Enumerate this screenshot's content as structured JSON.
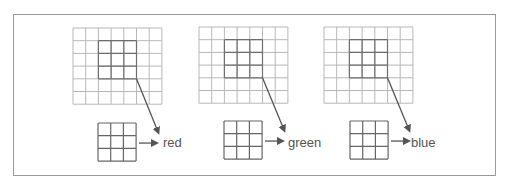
{
  "diagram": {
    "panels": [
      {
        "id": "red",
        "label": "red"
      },
      {
        "id": "green",
        "label": "green"
      },
      {
        "id": "blue",
        "label": "blue"
      }
    ],
    "grid": {
      "columns": 7,
      "rows": 6,
      "highlight": {
        "col_start": 3,
        "row_start": 2,
        "size": 3
      }
    },
    "kernel": {
      "columns": 3,
      "rows": 3
    },
    "colors": {
      "grid_line": "#b8b8b8",
      "highlight_line": "#6e6e6e",
      "kernel_line": "#666666",
      "arrow": "#555555",
      "frame": "#9a9a9a",
      "label_text": "#555555"
    }
  }
}
